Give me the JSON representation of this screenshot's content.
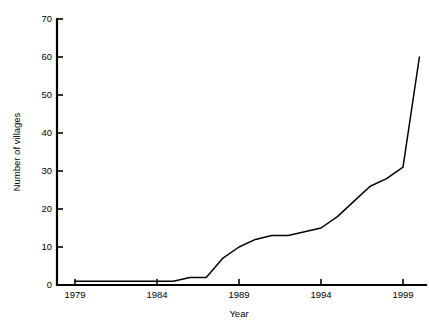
{
  "chart_data": {
    "type": "line",
    "title": "",
    "xlabel": "Year",
    "ylabel": "Number of villages",
    "xlim": [
      1978,
      2000.5
    ],
    "ylim": [
      0,
      70
    ],
    "grid": false,
    "legend": false,
    "xticks": [
      1979,
      1984,
      1989,
      1994,
      1999
    ],
    "xtick_labels": [
      "1979",
      "1984",
      "1989",
      "1994",
      "1999"
    ],
    "yticks": [
      0,
      10,
      20,
      30,
      40,
      50,
      60,
      70
    ],
    "ytick_labels": [
      "0",
      "10",
      "20",
      "30",
      "40",
      "50",
      "60",
      "70"
    ],
    "series": [
      {
        "name": "Number of villages",
        "color": "#000000",
        "x": [
          1979,
          1980,
          1981,
          1982,
          1983,
          1984,
          1985,
          1986,
          1987,
          1988,
          1989,
          1990,
          1991,
          1992,
          1993,
          1994,
          1995,
          1996,
          1997,
          1998,
          1999,
          2000
        ],
        "values": [
          1,
          1,
          1,
          1,
          1,
          1,
          1,
          2,
          2,
          7,
          10,
          12,
          13,
          13,
          14,
          15,
          18,
          22,
          26,
          28,
          31,
          60
        ]
      }
    ]
  },
  "axes": {
    "y_title": "Number of villages",
    "x_title": "Year"
  }
}
